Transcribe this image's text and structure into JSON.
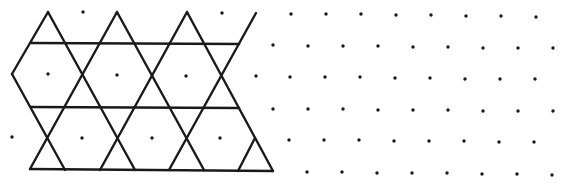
{
  "diagram": {
    "type": "isometric-dot-grid-with-trihexagonal-tiling",
    "colors": {
      "background": "#ffffff",
      "line": "#1a1a1a",
      "dot": "#1a1a1a"
    },
    "line_width": 2.4,
    "dot_radius": 1.7,
    "lines": [
      {
        "x1": 31,
        "y1": 43,
        "x2": 239,
        "y2": 44
      },
      {
        "x1": 31,
        "y1": 107,
        "x2": 239,
        "y2": 108
      },
      {
        "x1": 30,
        "y1": 169,
        "x2": 273,
        "y2": 171
      },
      {
        "x1": 12,
        "y1": 74,
        "x2": 65,
        "y2": 170
      },
      {
        "x1": 48,
        "y1": 12,
        "x2": 135,
        "y2": 170
      },
      {
        "x1": 117,
        "y1": 12,
        "x2": 204,
        "y2": 170
      },
      {
        "x1": 187,
        "y1": 12,
        "x2": 273,
        "y2": 171
      },
      {
        "x1": 48,
        "y1": 12,
        "x2": 12,
        "y2": 74
      },
      {
        "x1": 117,
        "y1": 12,
        "x2": 30,
        "y2": 169
      },
      {
        "x1": 187,
        "y1": 12,
        "x2": 100,
        "y2": 170
      },
      {
        "x1": 256,
        "y1": 13,
        "x2": 169,
        "y2": 170
      },
      {
        "x1": 255,
        "y1": 138,
        "x2": 238,
        "y2": 171
      }
    ],
    "dots": [
      [
        83,
        12
      ],
      [
        222,
        13
      ],
      [
        291,
        14
      ],
      [
        326,
        14
      ],
      [
        361,
        14
      ],
      [
        396,
        15
      ],
      [
        431,
        15
      ],
      [
        466,
        16
      ],
      [
        501,
        16
      ],
      [
        536,
        17
      ],
      [
        273,
        45
      ],
      [
        308,
        46
      ],
      [
        343,
        46
      ],
      [
        378,
        46
      ],
      [
        413,
        47
      ],
      [
        448,
        47
      ],
      [
        483,
        48
      ],
      [
        518,
        48
      ],
      [
        553,
        48
      ],
      [
        48,
        74
      ],
      [
        117,
        75
      ],
      [
        186,
        76
      ],
      [
        256,
        76
      ],
      [
        290,
        77
      ],
      [
        325,
        77
      ],
      [
        360,
        77
      ],
      [
        395,
        78
      ],
      [
        430,
        78
      ],
      [
        465,
        79
      ],
      [
        500,
        79
      ],
      [
        535,
        79
      ],
      [
        273,
        109
      ],
      [
        308,
        109
      ],
      [
        343,
        109
      ],
      [
        378,
        110
      ],
      [
        413,
        110
      ],
      [
        448,
        110
      ],
      [
        483,
        111
      ],
      [
        518,
        111
      ],
      [
        553,
        111
      ],
      [
        12,
        137
      ],
      [
        82,
        138
      ],
      [
        152,
        138
      ],
      [
        220,
        138
      ],
      [
        289,
        140
      ],
      [
        324,
        140
      ],
      [
        359,
        140
      ],
      [
        394,
        141
      ],
      [
        429,
        141
      ],
      [
        464,
        141
      ],
      [
        499,
        142
      ],
      [
        534,
        142
      ],
      [
        307,
        172
      ],
      [
        342,
        172
      ],
      [
        377,
        173
      ],
      [
        412,
        173
      ],
      [
        447,
        173
      ],
      [
        482,
        174
      ],
      [
        517,
        174
      ],
      [
        552,
        175
      ]
    ]
  }
}
